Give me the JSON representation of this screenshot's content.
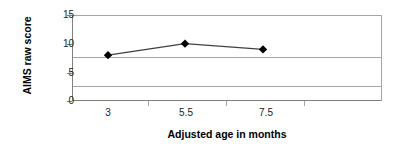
{
  "chart_data": {
    "type": "line",
    "title": "",
    "subtitle": "",
    "xlabel": "Adjusted age in months",
    "ylabel": "AIMS raw score",
    "categories": [
      "3",
      "5.5",
      "7.5"
    ],
    "x": [
      3,
      5.5,
      7.5
    ],
    "values": [
      8,
      10,
      9
    ],
    "series": [
      {
        "name": "AIMS raw score",
        "values": [
          8,
          10,
          9
        ],
        "marker": "diamond",
        "marker_color": "#000000",
        "line_color": "#404040"
      }
    ],
    "ylim": [
      0,
      15
    ],
    "yticks": [
      0,
      5,
      10,
      15
    ],
    "ytick_labels": [
      "0",
      "5",
      "10",
      "15"
    ],
    "xtick_labels": [
      "3",
      "5.5",
      "7.5"
    ],
    "grid": "horizontal",
    "legend": "none",
    "legend_position": "none",
    "background_color": "#ffffff",
    "gridline_color": "#a6a6a6",
    "axis_color": "#808080"
  },
  "axes": {
    "y_title": "AIMS raw score",
    "x_title": "Adjusted age in months",
    "y_labels": [
      "15",
      "10",
      "5",
      "0"
    ],
    "x_labels": [
      "3",
      "5.5",
      "7.5"
    ]
  }
}
